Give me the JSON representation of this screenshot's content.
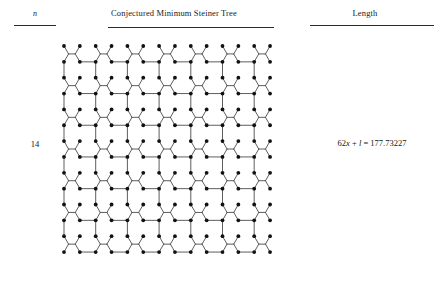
{
  "table": {
    "headers": {
      "n": "n",
      "tree": "Conjectured Minimum Steiner Tree",
      "length": "Length"
    },
    "row": {
      "n_value": "14",
      "length_prefix": "62",
      "length_var1": "x",
      "length_plus": " + ",
      "length_var2": "l",
      "length_eq": " = ",
      "length_value": "177.73227",
      "length_full": "62x + l = 177.73227"
    }
  },
  "figure": {
    "name": "conjectured-minimum-steiner-tree-14",
    "grid_size": 14,
    "terminal_count": 196,
    "node_color": "#111111",
    "edge_color": "#555555",
    "background": "#ffffff",
    "geometry": {
      "cell": 15.85,
      "origin_x": 6,
      "origin_y": 6,
      "node_radius": 1.9,
      "edge_width": 0.95
    }
  },
  "colors": {
    "rule": "#2b2b2b",
    "text": "#141414",
    "page_background": "#ffffff"
  }
}
